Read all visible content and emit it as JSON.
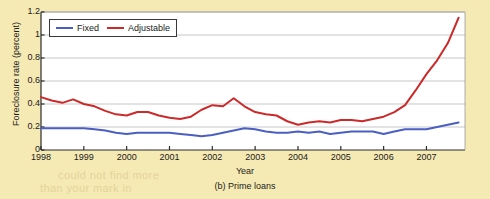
{
  "figure": {
    "caption": "(b) Prime loans",
    "background_color": "#f6eab4",
    "plot_background_color": "#ffffff"
  },
  "legend": {
    "position": "top-left-inside",
    "entries": [
      {
        "label": "Fixed",
        "color": "#4a5fc1"
      },
      {
        "label": "Adjustable",
        "color": "#cc2a2a"
      }
    ]
  },
  "axes": {
    "ylabel": "Foreclosure rate (percent)",
    "xlabel": "Year",
    "ytick_labels": [
      "1.2",
      "1",
      "0.8",
      "0.6",
      "0.4",
      "0.2",
      "0"
    ],
    "xtick_labels": [
      "1998",
      "1999",
      "2000",
      "2001",
      "2002",
      "2003",
      "2004",
      "2005",
      "2006",
      "2007"
    ]
  },
  "chart_data": {
    "type": "line",
    "title": "(b) Prime loans",
    "xlabel": "Year",
    "ylabel": "Foreclosure rate (percent)",
    "xlim": [
      1998.0,
      2007.9
    ],
    "ylim": [
      0,
      1.2
    ],
    "yticks": [
      0,
      0.2,
      0.4,
      0.6,
      0.8,
      1.0,
      1.2
    ],
    "xticks": [
      1998,
      1999,
      2000,
      2001,
      2002,
      2003,
      2004,
      2005,
      2006,
      2007
    ],
    "grid": "horizontal",
    "legend_position": "upper left",
    "x": [
      1998.0,
      1998.25,
      1998.5,
      1998.75,
      1999.0,
      1999.25,
      1999.5,
      1999.75,
      2000.0,
      2000.25,
      2000.5,
      2000.75,
      2001.0,
      2001.25,
      2001.5,
      2001.75,
      2002.0,
      2002.25,
      2002.5,
      2002.75,
      2003.0,
      2003.25,
      2003.5,
      2003.75,
      2004.0,
      2004.25,
      2004.5,
      2004.75,
      2005.0,
      2005.25,
      2005.5,
      2005.75,
      2006.0,
      2006.25,
      2006.5,
      2006.75,
      2007.0,
      2007.25,
      2007.5,
      2007.75
    ],
    "series": [
      {
        "name": "Fixed",
        "color": "#4a5fc1",
        "values": [
          0.19,
          0.19,
          0.19,
          0.19,
          0.19,
          0.18,
          0.17,
          0.15,
          0.14,
          0.15,
          0.15,
          0.15,
          0.15,
          0.14,
          0.13,
          0.12,
          0.13,
          0.15,
          0.17,
          0.19,
          0.18,
          0.16,
          0.15,
          0.15,
          0.16,
          0.15,
          0.16,
          0.14,
          0.15,
          0.16,
          0.16,
          0.16,
          0.14,
          0.16,
          0.18,
          0.18,
          0.18,
          0.2,
          0.22,
          0.24
        ]
      },
      {
        "name": "Adjustable",
        "color": "#cc2a2a",
        "values": [
          0.46,
          0.43,
          0.41,
          0.44,
          0.4,
          0.38,
          0.34,
          0.31,
          0.3,
          0.33,
          0.33,
          0.3,
          0.28,
          0.27,
          0.29,
          0.35,
          0.39,
          0.38,
          0.45,
          0.38,
          0.33,
          0.31,
          0.3,
          0.25,
          0.22,
          0.24,
          0.25,
          0.24,
          0.26,
          0.26,
          0.25,
          0.27,
          0.29,
          0.33,
          0.39,
          0.52,
          0.66,
          0.78,
          0.93,
          1.15
        ]
      }
    ]
  },
  "bleed_through": {
    "line1": "could not find more",
    "line2": "than your mark in",
    "faint1": "the marks",
    "faint2": "the same",
    "faint3": "of more"
  }
}
